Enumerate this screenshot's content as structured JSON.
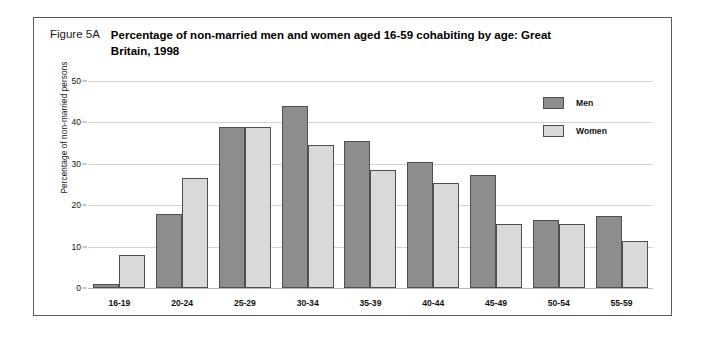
{
  "figure": {
    "number": "Figure 5A",
    "title": "Percentage of non-married men and women aged 16-59 cohabiting by age: Great Britain, 1998"
  },
  "legend": {
    "items": [
      {
        "label": "Men",
        "color": "#8d8d8d",
        "swatch_name": "legend-swatch-men"
      },
      {
        "label": "Women",
        "color": "#d9d9d9",
        "swatch_name": "legend-swatch-women"
      }
    ]
  },
  "chart_data": {
    "type": "bar",
    "title": "Percentage of non-married men and women aged 16-59 cohabiting by age: Great Britain, 1998",
    "xlabel": "",
    "ylabel": "Percentage of non-married persons",
    "categories": [
      "16-19",
      "20-24",
      "25-29",
      "30-34",
      "35-39",
      "40-44",
      "45-49",
      "50-54",
      "55-59"
    ],
    "series": [
      {
        "name": "Men",
        "color": "#8d8d8d",
        "values": [
          1.0,
          17.9,
          38.9,
          44.0,
          35.5,
          30.5,
          27.3,
          16.4,
          17.4
        ]
      },
      {
        "name": "Women",
        "color": "#d9d9d9",
        "values": [
          8.0,
          26.6,
          38.9,
          34.5,
          28.5,
          25.3,
          15.5,
          15.5,
          11.3
        ]
      }
    ],
    "ylim": [
      0,
      50
    ],
    "yticks": [
      0,
      10,
      20,
      30,
      40,
      50
    ],
    "grid": true,
    "legend_position": "top-right"
  }
}
